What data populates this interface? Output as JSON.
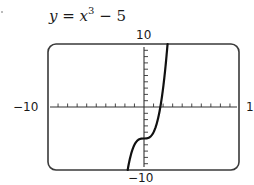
{
  "chart_data": {
    "type": "line",
    "equation": "y = x^3 - 5",
    "xlabel": "",
    "ylabel": "",
    "xlim": [
      -10,
      10
    ],
    "ylim": [
      -10,
      10
    ],
    "x_tick_step": 1,
    "y_tick_step": 1,
    "grid": false,
    "window_labels": {
      "xmin": "−10",
      "xmax": "10",
      "ymin": "−10",
      "ymax": "10"
    },
    "series": [
      {
        "name": "y = x^3 - 5",
        "x": [
          -1.71,
          -1.5,
          -1.25,
          -1.0,
          -0.75,
          -0.5,
          -0.25,
          0,
          0.25,
          0.5,
          0.75,
          1.0,
          1.25,
          1.5,
          1.75,
          2.0,
          2.25,
          2.47
        ],
        "y": [
          -10.0,
          -8.38,
          -6.95,
          -6.0,
          -5.42,
          -5.13,
          -5.02,
          -5.0,
          -4.98,
          -4.88,
          -4.58,
          -4.0,
          -3.05,
          -1.63,
          0.36,
          3.0,
          6.39,
          10.0
        ]
      }
    ]
  },
  "labels": {
    "title_var": "y",
    "title_eq": " = ",
    "title_x": "x",
    "title_exp": "3",
    "title_tail": " − 5",
    "ymax": "10",
    "ymin": "−10",
    "xmin": "−10",
    "xmax": "10"
  },
  "style": {
    "frame_color": "#3a3a3a",
    "axis_color": "#333333",
    "curve_color": "#111111"
  }
}
